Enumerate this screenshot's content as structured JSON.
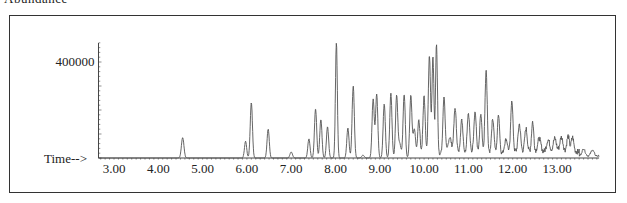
{
  "header": {
    "cut_label": "Abundance"
  },
  "chart_data": {
    "type": "line",
    "title": "",
    "xlabel": "Time-->",
    "ylabel": "Abundance",
    "xlim": [
      2.65,
      13.95
    ],
    "ylim": [
      0,
      480000
    ],
    "x_ticks": [
      "3.00",
      "4.00",
      "5.00",
      "6.00",
      "7.00",
      "8.00",
      "9.00",
      "10.00",
      "11.00",
      "12.00",
      "13.00"
    ],
    "y_ticks": [
      "400000"
    ],
    "grid": false,
    "legend": null,
    "peaks": [
      {
        "t": 4.55,
        "v": 85000,
        "w": 0.04
      },
      {
        "t": 5.97,
        "v": 70000,
        "w": 0.035
      },
      {
        "t": 6.1,
        "v": 230000,
        "w": 0.035
      },
      {
        "t": 6.48,
        "v": 120000,
        "w": 0.035
      },
      {
        "t": 7.0,
        "v": 25000,
        "w": 0.04
      },
      {
        "t": 7.4,
        "v": 80000,
        "w": 0.035
      },
      {
        "t": 7.55,
        "v": 205000,
        "w": 0.035
      },
      {
        "t": 7.67,
        "v": 160000,
        "w": 0.035
      },
      {
        "t": 7.82,
        "v": 130000,
        "w": 0.035
      },
      {
        "t": 8.02,
        "v": 480000,
        "w": 0.03
      },
      {
        "t": 8.28,
        "v": 125000,
        "w": 0.035
      },
      {
        "t": 8.4,
        "v": 300000,
        "w": 0.035
      },
      {
        "t": 8.62,
        "v": 12000,
        "w": 0.04
      },
      {
        "t": 8.85,
        "v": 245000,
        "w": 0.035
      },
      {
        "t": 8.93,
        "v": 265000,
        "w": 0.035
      },
      {
        "t": 9.1,
        "v": 225000,
        "w": 0.035
      },
      {
        "t": 9.25,
        "v": 270000,
        "w": 0.035
      },
      {
        "t": 9.38,
        "v": 260000,
        "w": 0.035
      },
      {
        "t": 9.45,
        "v": 60000,
        "w": 0.04
      },
      {
        "t": 9.55,
        "v": 265000,
        "w": 0.035
      },
      {
        "t": 9.7,
        "v": 260000,
        "w": 0.035
      },
      {
        "t": 9.78,
        "v": 120000,
        "w": 0.04
      },
      {
        "t": 9.88,
        "v": 160000,
        "w": 0.035
      },
      {
        "t": 10.0,
        "v": 240000,
        "w": 0.035
      },
      {
        "t": 10.12,
        "v": 410000,
        "w": 0.035
      },
      {
        "t": 10.2,
        "v": 405000,
        "w": 0.03
      },
      {
        "t": 10.28,
        "v": 460000,
        "w": 0.03
      },
      {
        "t": 10.45,
        "v": 240000,
        "w": 0.035
      },
      {
        "t": 10.58,
        "v": 70000,
        "w": 0.05
      },
      {
        "t": 10.7,
        "v": 190000,
        "w": 0.04
      },
      {
        "t": 10.85,
        "v": 140000,
        "w": 0.04
      },
      {
        "t": 11.0,
        "v": 170000,
        "w": 0.04
      },
      {
        "t": 11.15,
        "v": 175000,
        "w": 0.04
      },
      {
        "t": 11.28,
        "v": 165000,
        "w": 0.035
      },
      {
        "t": 11.4,
        "v": 345000,
        "w": 0.035
      },
      {
        "t": 11.55,
        "v": 145000,
        "w": 0.04
      },
      {
        "t": 11.68,
        "v": 165000,
        "w": 0.035
      },
      {
        "t": 11.85,
        "v": 60000,
        "w": 0.05
      },
      {
        "t": 11.98,
        "v": 225000,
        "w": 0.035
      },
      {
        "t": 12.15,
        "v": 115000,
        "w": 0.04
      },
      {
        "t": 12.3,
        "v": 95000,
        "w": 0.04
      },
      {
        "t": 12.45,
        "v": 125000,
        "w": 0.035
      },
      {
        "t": 12.6,
        "v": 55000,
        "w": 0.05
      },
      {
        "t": 12.8,
        "v": 50000,
        "w": 0.05
      },
      {
        "t": 12.95,
        "v": 55000,
        "w": 0.05
      },
      {
        "t": 13.1,
        "v": 60000,
        "w": 0.05
      },
      {
        "t": 13.25,
        "v": 65000,
        "w": 0.04
      },
      {
        "t": 13.35,
        "v": 60000,
        "w": 0.04
      },
      {
        "t": 13.6,
        "v": 30000,
        "w": 0.05
      },
      {
        "t": 13.8,
        "v": 25000,
        "w": 0.05
      }
    ],
    "baseline_noise": [
      {
        "from": 9.9,
        "to": 12.0,
        "level": 25000
      },
      {
        "from": 12.0,
        "to": 13.5,
        "level": 38000
      },
      {
        "from": 13.5,
        "to": 13.95,
        "level": 12000
      }
    ]
  },
  "style": {
    "line_color": "#555555",
    "axis_color": "#444444",
    "frame_color": "#333333"
  }
}
